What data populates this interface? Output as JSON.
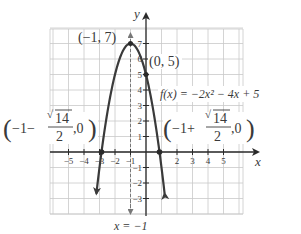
{
  "chart_data": {
    "type": "line",
    "title": "",
    "function": "f(x) = -2x^2 - 4x + 5",
    "function_label": "f(x) = −2x² − 4x + 5",
    "xlabel": "x",
    "ylabel": "y",
    "xlim": [
      -6,
      6
    ],
    "ylim": [
      -4,
      8
    ],
    "grid": true,
    "x_ticks": [
      -5,
      -4,
      -3,
      -2,
      -1,
      2,
      3,
      4,
      5
    ],
    "x_tick_labels": [
      "−5",
      "−4",
      "−3",
      "−2",
      "−1",
      "2",
      "3",
      "4",
      "5"
    ],
    "y_ticks": [
      7,
      6,
      5,
      4,
      3,
      2,
      1,
      -1,
      -2,
      -3
    ],
    "y_tick_labels": [
      "7",
      "6",
      "5",
      "4",
      "3",
      "2",
      "1",
      "1",
      "2",
      "3"
    ],
    "series": [
      {
        "name": "f(x) = -2x^2 - 4x + 5",
        "x": [
          -3.2,
          -2.87,
          -2.5,
          -2,
          -1.5,
          -1,
          -0.5,
          0,
          0.5,
          0.87,
          1.2
        ],
        "y": [
          -3.88,
          0,
          2.5,
          5,
          6.5,
          7,
          6.5,
          5,
          2.5,
          0,
          -3.88
        ]
      }
    ],
    "axis_of_symmetry": {
      "label": "x = −1",
      "x": -1
    },
    "annotations": [
      {
        "label": "(−1, 7)",
        "x": -1,
        "y": 7,
        "kind": "vertex"
      },
      {
        "label": "(0, 5)",
        "x": 0,
        "y": 5,
        "kind": "y-intercept"
      },
      {
        "label_prefix": "−1−",
        "label_radicand": "14",
        "label_denominator": "2",
        "label_suffix": ",0",
        "x": -2.87,
        "y": 0,
        "kind": "x-intercept"
      },
      {
        "label_prefix": "−1+",
        "label_radicand": "14",
        "label_denominator": "2",
        "label_suffix": ",0",
        "x": 0.87,
        "y": 0,
        "kind": "x-intercept"
      }
    ]
  },
  "colors": {
    "curve": "#3a3a3a",
    "grid": "#c9c9c9",
    "axis": "#2a2a2a",
    "text": "#3a3a3a",
    "dashed": "#777777"
  }
}
